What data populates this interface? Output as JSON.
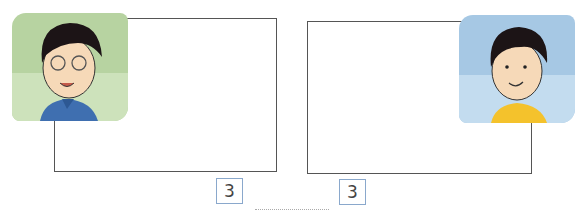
{
  "left_panel": {
    "character": "boy-with-glasses",
    "background_color": "#b9d4a4",
    "shirt_color": "#3f6fb0"
  },
  "right_panel": {
    "character": "boy-yellow-shirt",
    "background_color": "#a9cbe6",
    "shirt_color": "#f4c22c"
  },
  "numbers": {
    "left": "3",
    "right": "3"
  }
}
